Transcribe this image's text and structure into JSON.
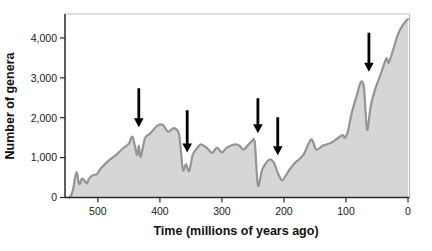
{
  "page": {
    "background": "#ffffff"
  },
  "chart_data": {
    "type": "area",
    "title": "",
    "xlabel": "Time (millions of years ago)",
    "ylabel": "Number of genera",
    "xlim": [
      553,
      0
    ],
    "ylim": [
      0,
      4600
    ],
    "grid": false,
    "legend": "none",
    "x_ticks": [
      {
        "v": 500,
        "label": "500"
      },
      {
        "v": 400,
        "label": "400"
      },
      {
        "v": 300,
        "label": "300"
      },
      {
        "v": 200,
        "label": "200"
      },
      {
        "v": 100,
        "label": "100"
      },
      {
        "v": 0,
        "label": "0"
      }
    ],
    "y_ticks": [
      {
        "v": 0,
        "label": "0"
      },
      {
        "v": 1000,
        "label": "1,000"
      },
      {
        "v": 2000,
        "label": "2,000"
      },
      {
        "v": 3000,
        "label": "3,000"
      },
      {
        "v": 4000,
        "label": "4,000"
      }
    ],
    "series": [
      {
        "name": "genus diversity",
        "points": [
          [
            546,
            0
          ],
          [
            543,
            60
          ],
          [
            540,
            200
          ],
          [
            537,
            480
          ],
          [
            534,
            630
          ],
          [
            531,
            380
          ],
          [
            529,
            340
          ],
          [
            526,
            470
          ],
          [
            522,
            430
          ],
          [
            518,
            350
          ],
          [
            514,
            480
          ],
          [
            508,
            560
          ],
          [
            502,
            580
          ],
          [
            494,
            750
          ],
          [
            482,
            930
          ],
          [
            471,
            1060
          ],
          [
            460,
            1220
          ],
          [
            450,
            1350
          ],
          [
            444,
            1520
          ],
          [
            437,
            1070
          ],
          [
            434,
            1290
          ],
          [
            431,
            1020
          ],
          [
            424,
            1490
          ],
          [
            416,
            1600
          ],
          [
            405,
            1790
          ],
          [
            395,
            1820
          ],
          [
            387,
            1650
          ],
          [
            377,
            1740
          ],
          [
            369,
            1570
          ],
          [
            363,
            700
          ],
          [
            358,
            840
          ],
          [
            353,
            660
          ],
          [
            347,
            1070
          ],
          [
            340,
            1240
          ],
          [
            334,
            1330
          ],
          [
            324,
            1240
          ],
          [
            316,
            1120
          ],
          [
            308,
            1250
          ],
          [
            300,
            1130
          ],
          [
            292,
            1250
          ],
          [
            279,
            1330
          ],
          [
            271,
            1290
          ],
          [
            265,
            1200
          ],
          [
            252,
            1410
          ],
          [
            247,
            1380
          ],
          [
            242,
            300
          ],
          [
            235,
            700
          ],
          [
            224,
            950
          ],
          [
            216,
            870
          ],
          [
            210,
            620
          ],
          [
            203,
            430
          ],
          [
            195,
            600
          ],
          [
            190,
            720
          ],
          [
            181,
            890
          ],
          [
            169,
            1060
          ],
          [
            156,
            1460
          ],
          [
            148,
            1200
          ],
          [
            137,
            1300
          ],
          [
            123,
            1380
          ],
          [
            106,
            1560
          ],
          [
            102,
            1500
          ],
          [
            97,
            1650
          ],
          [
            90,
            2170
          ],
          [
            82,
            2590
          ],
          [
            76,
            2900
          ],
          [
            71,
            2750
          ],
          [
            66,
            1700
          ],
          [
            60,
            2300
          ],
          [
            53,
            2710
          ],
          [
            45,
            3050
          ],
          [
            35,
            3480
          ],
          [
            31,
            3380
          ],
          [
            24,
            3700
          ],
          [
            16,
            4100
          ],
          [
            8,
            4330
          ],
          [
            2,
            4450
          ],
          [
            0,
            4470
          ]
        ]
      }
    ],
    "mass_extinction_arrows": [
      {
        "time": 434,
        "arrow_tip_n": 1760,
        "arrow_top_n": 2740
      },
      {
        "time": 356,
        "arrow_tip_n": 1130,
        "arrow_top_n": 2190
      },
      {
        "time": 242,
        "arrow_tip_n": 1610,
        "arrow_top_n": 2490
      },
      {
        "time": 210,
        "arrow_tip_n": 1060,
        "arrow_top_n": 2010
      },
      {
        "time": 63,
        "arrow_tip_n": 3150,
        "arrow_top_n": 4130
      }
    ],
    "colors": {
      "area_fill": "#d6d6d6",
      "curve_stroke": "#949494",
      "axis": "#2a2a2a",
      "frame": "#bfbfbf",
      "arrow": "#000000",
      "text": "#111111"
    }
  }
}
